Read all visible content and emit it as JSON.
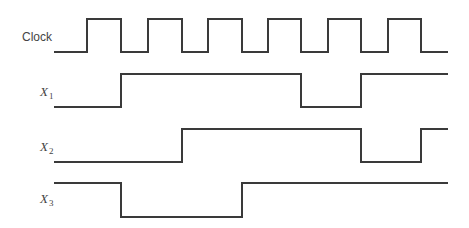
{
  "diagram": {
    "type": "timing-diagram",
    "x_start": 54,
    "x_end": 448,
    "signals": [
      {
        "id": "clock",
        "label": "Clock",
        "subscript": "",
        "label_x": 22,
        "label_y": 41,
        "high_y": 19,
        "low_y": 52,
        "initial": 0,
        "edges": [
          87,
          121,
          148,
          182,
          208,
          242,
          268,
          301,
          328,
          361,
          388,
          421
        ]
      },
      {
        "id": "x1",
        "label": "X",
        "subscript": "1",
        "label_x": 40,
        "label_y": 96,
        "high_y": 74,
        "low_y": 107,
        "initial": 0,
        "edges": [
          121,
          301,
          361
        ]
      },
      {
        "id": "x2",
        "label": "X",
        "subscript": "2",
        "label_x": 40,
        "label_y": 151,
        "high_y": 129,
        "low_y": 162,
        "initial": 0,
        "edges": [
          182,
          361,
          421
        ]
      },
      {
        "id": "x3",
        "label": "X",
        "subscript": "3",
        "label_x": 40,
        "label_y": 203,
        "high_y": 183,
        "low_y": 217,
        "initial": 1,
        "edges": [
          121,
          242
        ]
      }
    ]
  }
}
